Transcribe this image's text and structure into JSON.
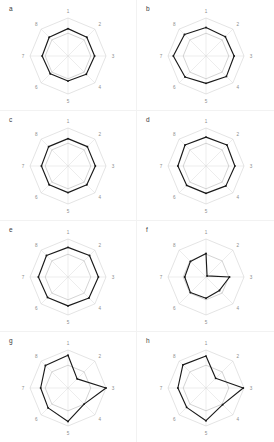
{
  "figure": {
    "type": "radar-grid",
    "rows": 4,
    "cols": 2,
    "axis_count": 8,
    "axis_labels": [
      "1",
      "2",
      "3",
      "4",
      "5",
      "6",
      "7",
      "8"
    ],
    "colors": {
      "data_line": "#1a1a1a",
      "reference_line": "#a8a8a8",
      "grid_line": "#c9c9c9",
      "label_text": "#8c8c8c",
      "panel_label_text": "#3a3a3a",
      "background": "#ffffff"
    }
  },
  "chart_data": {
    "type": "line",
    "title": "",
    "xlabel": "",
    "ylabel": "",
    "categories": [
      "1",
      "2",
      "3",
      "4",
      "5",
      "6",
      "7",
      "8"
    ],
    "ylim": [
      0,
      1
    ],
    "grid": true,
    "legend": "none",
    "panels": [
      {
        "label": "a",
        "series": [
          {
            "name": "reference",
            "values": [
              0.6,
              0.6,
              0.6,
              0.6,
              0.6,
              0.6,
              0.6,
              0.6
            ]
          },
          {
            "name": "data",
            "values": [
              0.72,
              0.7,
              0.7,
              0.68,
              0.66,
              0.66,
              0.68,
              0.7
            ]
          }
        ]
      },
      {
        "label": "b",
        "series": [
          {
            "name": "reference",
            "values": [
              0.6,
              0.6,
              0.6,
              0.6,
              0.6,
              0.6,
              0.6,
              0.6
            ]
          },
          {
            "name": "data",
            "values": [
              0.75,
              0.72,
              0.74,
              0.76,
              0.72,
              0.78,
              0.86,
              0.8
            ]
          }
        ]
      },
      {
        "label": "c",
        "series": [
          {
            "name": "reference",
            "values": [
              0.6,
              0.6,
              0.6,
              0.6,
              0.6,
              0.6,
              0.6,
              0.6
            ]
          },
          {
            "name": "data",
            "values": [
              0.72,
              0.72,
              0.72,
              0.7,
              0.7,
              0.7,
              0.7,
              0.72
            ]
          }
        ]
      },
      {
        "label": "d",
        "series": [
          {
            "name": "reference",
            "values": [
              0.6,
              0.6,
              0.6,
              0.6,
              0.6,
              0.6,
              0.6,
              0.6
            ]
          },
          {
            "name": "data",
            "values": [
              0.76,
              0.78,
              0.76,
              0.74,
              0.72,
              0.72,
              0.74,
              0.78
            ]
          }
        ]
      },
      {
        "label": "e",
        "series": [
          {
            "name": "reference",
            "values": [
              0.6,
              0.6,
              0.6,
              0.6,
              0.6,
              0.6,
              0.6,
              0.6
            ]
          },
          {
            "name": "data",
            "values": [
              0.78,
              0.8,
              0.8,
              0.78,
              0.76,
              0.76,
              0.78,
              0.8
            ]
          }
        ]
      },
      {
        "label": "f",
        "series": [
          {
            "name": "reference",
            "values": [
              0.6,
              0.6,
              0.6,
              0.6,
              0.6,
              0.6,
              0.6,
              0.6
            ]
          },
          {
            "name": "data",
            "values": [
              0.62,
              0.04,
              0.62,
              0.5,
              0.56,
              0.58,
              0.56,
              0.58
            ]
          }
        ]
      },
      {
        "label": "g",
        "series": [
          {
            "name": "reference",
            "values": [
              0.6,
              0.6,
              0.6,
              0.6,
              0.6,
              0.6,
              0.6,
              0.6
            ]
          },
          {
            "name": "data",
            "values": [
              0.86,
              0.34,
              1.0,
              0.6,
              0.88,
              0.74,
              0.72,
              0.84
            ]
          }
        ]
      },
      {
        "label": "h",
        "series": [
          {
            "name": "reference",
            "values": [
              0.6,
              0.6,
              0.6,
              0.6,
              0.6,
              0.6,
              0.6,
              0.6
            ]
          },
          {
            "name": "data",
            "values": [
              0.84,
              0.36,
              0.98,
              0.62,
              0.86,
              0.72,
              0.74,
              0.86
            ]
          }
        ]
      }
    ]
  }
}
